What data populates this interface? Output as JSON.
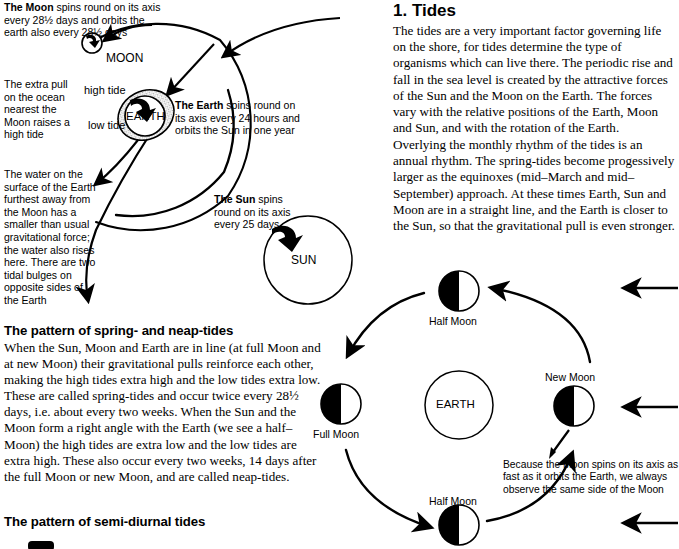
{
  "page": {
    "width": 678,
    "height": 549,
    "background": "#ffffff",
    "ink": "#000000"
  },
  "left_column": {
    "annotations": [
      {
        "name": "moon-annotation",
        "bold_lead": "The Moon",
        "text": " spins round on its axis every 28½ days and orbits the earth also every 28½ days",
        "full": "The Moon spins round on its axis every 28½ days and orbits the earth also every 28½ days"
      },
      {
        "name": "high-tide-annotation",
        "full": "The extra pull on the ocean nearest the Moon raises a high tide"
      },
      {
        "name": "far-bulge-annotation",
        "full": "The water on the surface of the Earth furthest away from the Moon has a smaller than usual gravitational force; the water also rises here. There are two tidal bulges on opposite sides of the Earth"
      },
      {
        "name": "earth-annotation",
        "bold_lead": "The Earth",
        "text": " spins round on its axis every 24 hours and orbits the Sun in one year",
        "full": "The Earth spins round on its axis every 24 hours and orbits the Sun in one year"
      },
      {
        "name": "sun-annotation",
        "bold_lead": "The Sun",
        "text": " spins round on its axis every 25 days",
        "full": "The Sun spins round on its axis every 25 days"
      }
    ],
    "diagram_labels": {
      "moon": "MOON",
      "earth": "EARTH",
      "sun": "SUN",
      "high_tide": "high tide",
      "low_tide": "low tide"
    },
    "heading_spring_neap": "The pattern of spring- and neap-tides",
    "paragraph_spring_neap": "When the Sun, Moon and Earth are in line (at full Moon and at new Moon) their gravitational pulls reinforce each other, making the high tides extra high and the low tides extra low. These are called spring-tides and occur twice every 28½ days, i.e. about every two weeks. When the Sun and the Moon form a right angle with the Earth (we see a half–Moon) the high tides are extra low and the low tides are extra high. These also occur every two weeks, 14 days after the full Moon or new Moon, and are called neap-tides.",
    "heading_semi_diurnal": "The pattern of semi-diurnal tides"
  },
  "right_column": {
    "heading": "1. Tides",
    "paragraphs": [
      "The tides are a very important factor governing life on the shore, for tides determine the type of organisms which can live there. The periodic rise and fall in the sea level is created by the attractive forces of the Sun and the Moon on the Earth. The forces vary with the relative positions of the Earth, Moon and Sun, and with the rotation of the Earth.",
      "Overlying the monthly rhythm of the tides is an annual rhythm. The spring-tides become progessively larger as the equinoxes (mid–March and mid–September) approach. At these times Earth, Sun and Moon are in a straight line, and the Earth is closer to the Sun, so that the gravitational pull is even stronger."
    ]
  },
  "moon_phase_diagram": {
    "center_label": "EARTH",
    "phases": [
      {
        "name": "half-moon-top",
        "label": "Half Moon",
        "dark_side": "left"
      },
      {
        "name": "new-moon-right",
        "label": "New Moon",
        "dark_side": "left"
      },
      {
        "name": "half-moon-bottom",
        "label": "Half Moon",
        "dark_side": "left"
      },
      {
        "name": "full-moon-left",
        "label": "Full Moon",
        "dark_side": "left"
      }
    ],
    "caption": "Because the Moon spins on its axis as fast as it orbits the Earth, we always observe the same side of the Moon",
    "sunlight_arrows": 3,
    "sunlight_direction": "left"
  }
}
